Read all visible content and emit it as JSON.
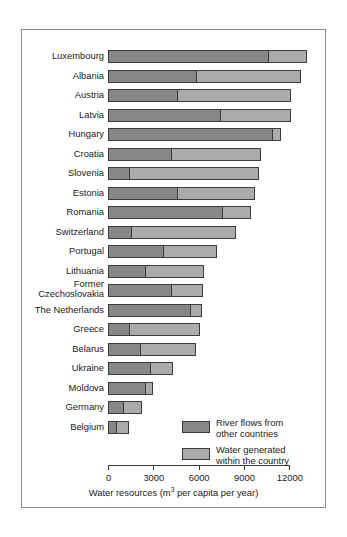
{
  "chart_data": {
    "type": "bar",
    "orientation": "horizontal",
    "stacked": true,
    "title": "",
    "xlabel": "Water resources (m3 per capita per year)",
    "xlabel_parts": {
      "before": "Water resources (m",
      "sup": "3",
      "after": " per capita per year)"
    },
    "ylabel": "",
    "xlim": [
      0,
      13500
    ],
    "xticks": [
      0,
      3000,
      6000,
      9000,
      12000
    ],
    "xtick_labels": [
      "0",
      "3000",
      "6000",
      "9000",
      "12000"
    ],
    "grid": false,
    "legend_position": "inside-lower-right",
    "categories": [
      "Luxembourg",
      "Albania",
      "Austria",
      "Latvia",
      "Hungary",
      "Croatia",
      "Slovenia",
      "Estonia",
      "Romania",
      "Switzerland",
      "Portugal",
      "Lithuania",
      "Former Czechoslovakia",
      "The Netherlands",
      "Greece",
      "Belarus",
      "Ukraine",
      "Moldova",
      "Germany",
      "Belgium"
    ],
    "series": [
      {
        "name": "River flows from other countries",
        "color": "#878787",
        "values": [
          10570,
          5800,
          4570,
          7430,
          10830,
          4170,
          1370,
          4570,
          7570,
          1500,
          3650,
          2430,
          4170,
          5410,
          1370,
          2090,
          2800,
          2430,
          980,
          520
        ]
      },
      {
        "name": "Water generated within the country",
        "color": "#ababab",
        "values": [
          2610,
          6990,
          7560,
          4700,
          650,
          5940,
          8610,
          5150,
          1890,
          6980,
          3590,
          3900,
          2090,
          790,
          4700,
          3710,
          1500,
          570,
          1300,
          850
        ]
      }
    ],
    "totals": [
      13180,
      12790,
      12130,
      12130,
      11480,
      10110,
      9980,
      9720,
      9460,
      8480,
      7240,
      6330,
      6260,
      6200,
      6070,
      5800,
      4300,
      3000,
      2280,
      1370
    ]
  },
  "legend": {
    "items": [
      {
        "label_line1": "River flows from",
        "label_line2": "other countries",
        "color": "#878787"
      },
      {
        "label_line1": "Water generated",
        "label_line2": "within the country",
        "color": "#ababab"
      }
    ]
  },
  "colors": {
    "series_dark": "#878787",
    "series_light": "#ababab",
    "outline": "#3c3c3c",
    "frame": "#8d8d8d",
    "text": "#1a1a1a",
    "background": "#ffffff"
  }
}
